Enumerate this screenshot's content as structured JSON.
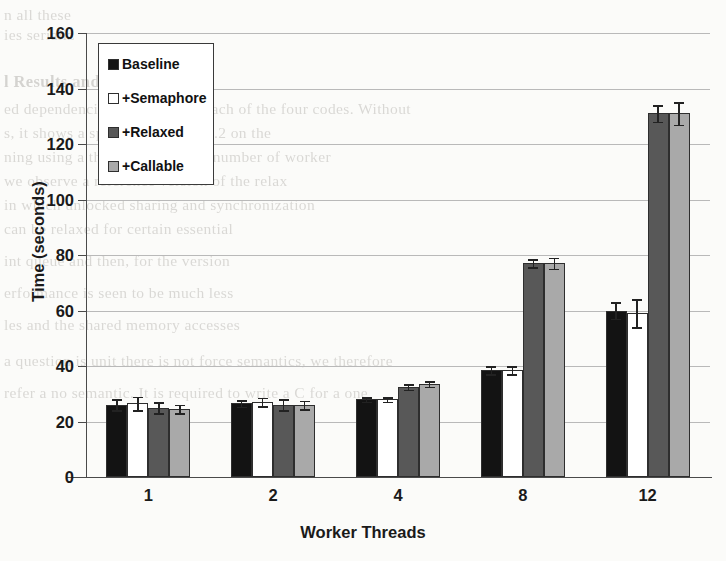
{
  "chart_data": {
    "type": "bar",
    "title": "",
    "xlabel": "Worker Threads",
    "ylabel": "Time (seconds)",
    "categories": [
      "1",
      "2",
      "4",
      "8",
      "12"
    ],
    "ylim": [
      0,
      160
    ],
    "ytick_values": [
      0,
      20,
      40,
      60,
      80,
      100,
      120,
      140,
      160
    ],
    "ytick_labels": [
      "0",
      "20",
      "40",
      "60",
      "80",
      "100",
      "120",
      "140",
      "160"
    ],
    "grid": true,
    "legend_position": "upper-left",
    "series": [
      {
        "name": "Baseline",
        "color": "#131313",
        "values": [
          26,
          26.5,
          28,
          38.5,
          60
        ],
        "errors": [
          2.0,
          1.2,
          0.8,
          1.5,
          3.0
        ]
      },
      {
        "name": "+Semaphore",
        "color": "#ffffff",
        "values": [
          26.5,
          27,
          28,
          38.5,
          59
        ],
        "errors": [
          2.5,
          1.5,
          0.8,
          1.5,
          5.0
        ]
      },
      {
        "name": "+Relaxed",
        "color": "#585858",
        "values": [
          25,
          26,
          32.5,
          77,
          131
        ],
        "errors": [
          2.0,
          2.0,
          1.0,
          1.5,
          3.0
        ]
      },
      {
        "name": "+Callable",
        "color": "#a9a9a9",
        "values": [
          24.5,
          26,
          33.5,
          77,
          131
        ],
        "errors": [
          1.5,
          1.5,
          1.0,
          2.0,
          4.0
        ]
      }
    ]
  },
  "legend": {
    "items": [
      {
        "label": "Baseline",
        "swatch": "s0"
      },
      {
        "label": "+Semaphore",
        "swatch": "s1"
      },
      {
        "label": "+Relaxed",
        "swatch": "s2"
      },
      {
        "label": "+Callable",
        "swatch": "s3"
      }
    ]
  },
  "page_bleed": {
    "heading": "l Results and Evaluation",
    "lines": [
      "n all these",
      "ies serializ",
      "ed dependencies, we compare each of the four codes. Without",
      "s, it shows a speedup of about 1.2 on the",
      "ning using a thread pool with a number of worker",
      "we observe a reference version of the relax",
      "in which unlocked sharing and synchronization",
      "can be relaxed for certain essential",
      "int queue and then, for the version",
      "erformance is seen to be much less",
      "les and the shared memory accesses",
      "a question is unit there is not force semantics, we therefore",
      "refer a no semantic. It is required to write a C for a one"
    ]
  }
}
